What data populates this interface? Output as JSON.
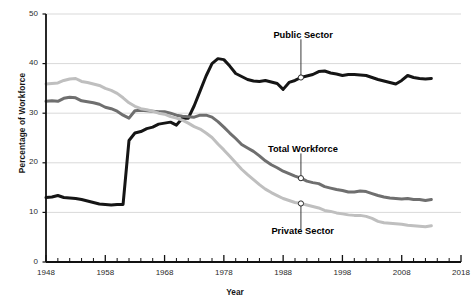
{
  "chart_data": {
    "type": "line",
    "title": "",
    "xlabel": "Year",
    "ylabel": "Percentage of Workforce",
    "xlim": [
      1948,
      2018
    ],
    "ylim": [
      0,
      50
    ],
    "grid": true,
    "legend_position": "inline-annotations",
    "y_ticks": [
      0,
      10,
      20,
      30,
      40,
      50
    ],
    "y_tick_labels": [
      "0",
      "10",
      "20",
      "30",
      "40",
      "50"
    ],
    "x_ticks": [
      1948,
      1958,
      1968,
      1978,
      1988,
      1998,
      2008,
      2018
    ],
    "x_tick_labels": [
      "1948",
      "1958",
      "1968",
      "1978",
      "1988",
      "1998",
      "2008",
      "2018"
    ],
    "x_minor_tick_interval": 2,
    "series": [
      {
        "name": "Public Sector",
        "color": "#151515",
        "x": [
          1948,
          1949,
          1950,
          1951,
          1952,
          1953,
          1954,
          1955,
          1956,
          1957,
          1958,
          1959,
          1960,
          1961,
          1962,
          1963,
          1964,
          1965,
          1966,
          1967,
          1968,
          1969,
          1970,
          1971,
          1972,
          1973,
          1974,
          1975,
          1976,
          1977,
          1978,
          1979,
          1980,
          1981,
          1982,
          1983,
          1984,
          1985,
          1986,
          1987,
          1988,
          1989,
          1990,
          1991,
          1992,
          1993,
          1994,
          1995,
          1996,
          1997,
          1998,
          1999,
          2000,
          2001,
          2002,
          2003,
          2004,
          2005,
          2006,
          2007,
          2008,
          2009,
          2010,
          2011,
          2012,
          2013
        ],
        "values": [
          13.0,
          13.1,
          13.4,
          13.0,
          12.9,
          12.8,
          12.6,
          12.3,
          12.0,
          11.7,
          11.6,
          11.5,
          11.6,
          11.6,
          24.5,
          26.0,
          26.3,
          26.9,
          27.2,
          27.8,
          28.0,
          28.2,
          27.6,
          29.0,
          29.0,
          31.5,
          34.5,
          37.5,
          40.0,
          41.0,
          40.8,
          39.5,
          38.0,
          37.4,
          36.8,
          36.5,
          36.4,
          36.6,
          36.3,
          36.0,
          34.8,
          36.2,
          36.6,
          37.2,
          37.5,
          37.8,
          38.4,
          38.5,
          38.1,
          37.9,
          37.6,
          37.8,
          37.8,
          37.7,
          37.6,
          37.2,
          36.8,
          36.5,
          36.2,
          35.9,
          36.6,
          37.6,
          37.2,
          37.0,
          36.9,
          37.0
        ]
      },
      {
        "name": "Total Workforce",
        "color": "#6f6f6f",
        "x": [
          1948,
          1949,
          1950,
          1951,
          1952,
          1953,
          1954,
          1955,
          1956,
          1957,
          1958,
          1959,
          1960,
          1961,
          1962,
          1963,
          1964,
          1965,
          1966,
          1967,
          1968,
          1969,
          1970,
          1971,
          1972,
          1973,
          1974,
          1975,
          1976,
          1977,
          1978,
          1979,
          1980,
          1981,
          1982,
          1983,
          1984,
          1985,
          1986,
          1987,
          1988,
          1989,
          1990,
          1991,
          1992,
          1993,
          1994,
          1995,
          1996,
          1997,
          1998,
          1999,
          2000,
          2001,
          2002,
          2003,
          2004,
          2005,
          2006,
          2007,
          2008,
          2009,
          2010,
          2011,
          2012,
          2013
        ],
        "values": [
          32.4,
          32.5,
          32.4,
          33.0,
          33.2,
          33.1,
          32.5,
          32.3,
          32.1,
          31.8,
          31.2,
          30.9,
          30.4,
          29.6,
          29.0,
          30.5,
          30.6,
          30.5,
          30.4,
          30.3,
          30.3,
          30.0,
          29.6,
          29.4,
          29.3,
          29.2,
          29.6,
          29.6,
          29.2,
          28.3,
          27.2,
          26.0,
          24.9,
          23.7,
          23.0,
          22.3,
          21.4,
          20.4,
          19.6,
          19.0,
          18.3,
          17.8,
          17.3,
          16.9,
          16.3,
          16.0,
          15.8,
          15.2,
          14.9,
          14.6,
          14.4,
          14.1,
          14.1,
          14.3,
          14.2,
          13.8,
          13.4,
          13.1,
          12.9,
          12.8,
          12.7,
          12.8,
          12.6,
          12.6,
          12.4,
          12.6
        ]
      },
      {
        "name": "Private Sector",
        "color": "#bfbfbf",
        "x": [
          1948,
          1949,
          1950,
          1951,
          1952,
          1953,
          1954,
          1955,
          1956,
          1957,
          1958,
          1959,
          1960,
          1961,
          1962,
          1963,
          1964,
          1965,
          1966,
          1967,
          1968,
          1969,
          1970,
          1971,
          1972,
          1973,
          1974,
          1975,
          1976,
          1977,
          1978,
          1979,
          1980,
          1981,
          1982,
          1983,
          1984,
          1985,
          1986,
          1987,
          1988,
          1989,
          1990,
          1991,
          1992,
          1993,
          1994,
          1995,
          1996,
          1997,
          1998,
          1999,
          2000,
          2001,
          2002,
          2003,
          2004,
          2005,
          2006,
          2007,
          2008,
          2009,
          2010,
          2011,
          2012,
          2013
        ],
        "values": [
          35.9,
          36.0,
          36.1,
          36.6,
          36.9,
          37.0,
          36.4,
          36.2,
          35.9,
          35.6,
          35.0,
          34.6,
          34.0,
          33.1,
          32.1,
          31.4,
          30.9,
          30.7,
          30.4,
          30.0,
          29.8,
          29.3,
          29.0,
          28.6,
          28.0,
          27.3,
          26.8,
          26.0,
          25.1,
          23.8,
          22.6,
          21.3,
          20.0,
          18.7,
          17.6,
          16.6,
          15.6,
          14.7,
          14.0,
          13.4,
          12.8,
          12.4,
          12.0,
          11.8,
          11.5,
          11.2,
          10.9,
          10.4,
          10.2,
          9.9,
          9.7,
          9.5,
          9.4,
          9.4,
          9.2,
          8.8,
          8.2,
          7.9,
          7.8,
          7.7,
          7.6,
          7.4,
          7.3,
          7.2,
          7.1,
          7.3
        ]
      }
    ],
    "annotations": [
      {
        "label": "Public Sector",
        "series": "Public Sector",
        "marker_x": 1991,
        "marker_y": 37.2,
        "label_x": 1985,
        "label_y": 45.5,
        "label_anchor": "middle"
      },
      {
        "label": "Total Workforce",
        "series": "Total Workforce",
        "marker_x": 1991,
        "marker_y": 16.9,
        "label_x": 1986,
        "label_y": 22.5,
        "label_anchor": "middle"
      },
      {
        "label": "Private Sector",
        "series": "Private Sector",
        "marker_x": 1991,
        "marker_y": 11.8,
        "label_x": 1986.5,
        "label_y": 6.0,
        "label_anchor": "middle"
      }
    ],
    "colors": {
      "public_sector": "#151515",
      "total_workforce": "#6f6f6f",
      "private_sector": "#bfbfbf",
      "grid": "#d9d9d9",
      "axis": "#111111",
      "background": "#ffffff",
      "text": "#1a1a1a"
    }
  }
}
